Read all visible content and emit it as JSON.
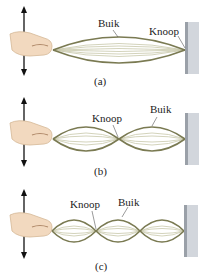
{
  "figure": {
    "panels": [
      {
        "id": "a",
        "caption": "(a)",
        "harmonic": 1,
        "loops": 1,
        "labels": {
          "antinode": "Buik",
          "node": "Knoop"
        }
      },
      {
        "id": "b",
        "caption": "(b)",
        "harmonic": 2,
        "loops": 2,
        "labels": {
          "node": "Knoop",
          "antinode": "Buik"
        }
      },
      {
        "id": "c",
        "caption": "(c)",
        "harmonic": 3,
        "loops": 3,
        "labels": {
          "node": "Knoop",
          "antinode": "Buik"
        }
      }
    ]
  },
  "colors": {
    "string": "#7a7a52",
    "string_faint": "#b8b89a",
    "wall": "#c9cdd3",
    "wall_edge": "#9aa0a8",
    "skin": "#f2d9bf",
    "arrow": "#111111"
  }
}
